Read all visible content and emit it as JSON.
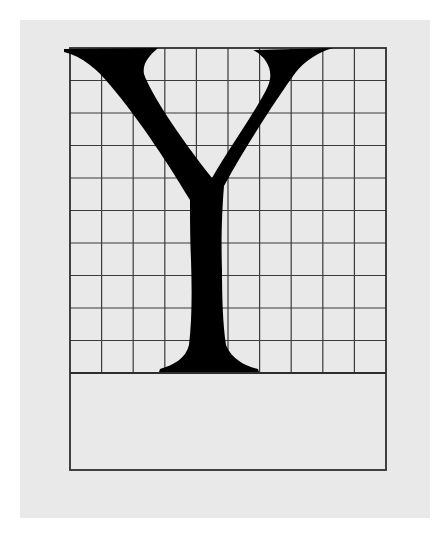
{
  "figure": {
    "glyph": "Y",
    "grid": {
      "columns": 10,
      "rows_above_baseline": 10,
      "left": 70,
      "right": 386,
      "top": 48,
      "baseline": 373,
      "box_bottom": 470
    },
    "colors": {
      "background": "#ffffff",
      "panel": "#e9e9e9",
      "grid_line": "#3a3a3a",
      "glyph": "#000000"
    }
  }
}
